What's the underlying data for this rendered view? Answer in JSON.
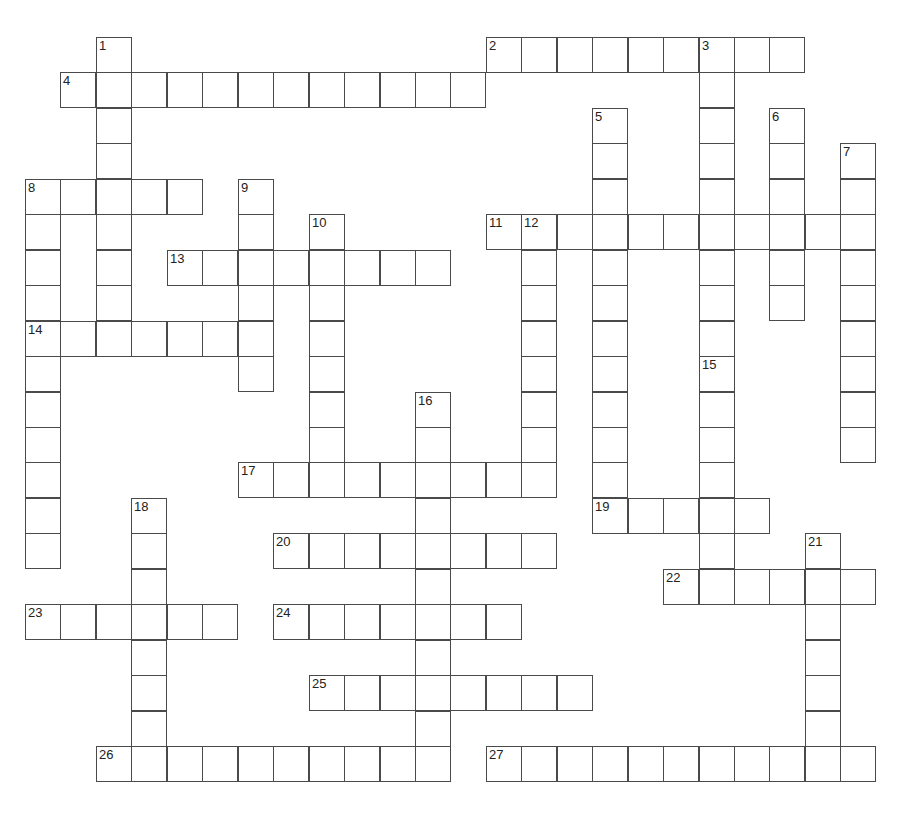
{
  "puzzle": {
    "type": "crossword",
    "grid": {
      "origin_x": 25,
      "origin_y": 37,
      "cell": 35.45
    },
    "words": [
      {
        "num": 1,
        "dir": "down",
        "col": 2,
        "row": 0,
        "len": 8
      },
      {
        "num": 2,
        "dir": "across",
        "col": 13,
        "row": 0,
        "len": 9
      },
      {
        "num": 3,
        "dir": "down",
        "col": 19,
        "row": 0,
        "len": 9
      },
      {
        "num": 4,
        "dir": "across",
        "col": 1,
        "row": 1,
        "len": 12
      },
      {
        "num": 5,
        "dir": "down",
        "col": 16,
        "row": 2,
        "len": 12
      },
      {
        "num": 6,
        "dir": "down",
        "col": 21,
        "row": 2,
        "len": 6
      },
      {
        "num": 7,
        "dir": "down",
        "col": 23,
        "row": 3,
        "len": 9
      },
      {
        "num": 8,
        "dir": "across",
        "col": 0,
        "row": 4,
        "len": 5
      },
      {
        "num": 8,
        "dir": "down",
        "col": 0,
        "row": 4,
        "len": 11
      },
      {
        "num": 9,
        "dir": "down",
        "col": 6,
        "row": 4,
        "len": 6
      },
      {
        "num": 10,
        "dir": "down",
        "col": 8,
        "row": 5,
        "len": 8
      },
      {
        "num": 11,
        "dir": "across",
        "col": 13,
        "row": 5,
        "len": 11
      },
      {
        "num": 12,
        "dir": "down",
        "col": 14,
        "row": 5,
        "len": 8
      },
      {
        "num": 13,
        "dir": "across",
        "col": 4,
        "row": 6,
        "len": 8
      },
      {
        "num": 14,
        "dir": "across",
        "col": 0,
        "row": 8,
        "len": 7
      },
      {
        "num": 15,
        "dir": "down",
        "col": 19,
        "row": 9,
        "len": 7
      },
      {
        "num": 16,
        "dir": "down",
        "col": 11,
        "row": 10,
        "len": 11
      },
      {
        "num": 17,
        "dir": "across",
        "col": 6,
        "row": 12,
        "len": 9
      },
      {
        "num": 18,
        "dir": "down",
        "col": 3,
        "row": 13,
        "len": 8
      },
      {
        "num": 19,
        "dir": "across",
        "col": 16,
        "row": 13,
        "len": 5
      },
      {
        "num": 20,
        "dir": "across",
        "col": 7,
        "row": 14,
        "len": 8
      },
      {
        "num": 21,
        "dir": "down",
        "col": 22,
        "row": 14,
        "len": 7
      },
      {
        "num": 22,
        "dir": "across",
        "col": 18,
        "row": 15,
        "len": 6
      },
      {
        "num": 23,
        "dir": "across",
        "col": 0,
        "row": 16,
        "len": 6
      },
      {
        "num": 24,
        "dir": "across",
        "col": 7,
        "row": 16,
        "len": 7
      },
      {
        "num": 25,
        "dir": "across",
        "col": 8,
        "row": 18,
        "len": 8
      },
      {
        "num": 26,
        "dir": "across",
        "col": 2,
        "row": 20,
        "len": 10
      },
      {
        "num": 27,
        "dir": "across",
        "col": 13,
        "row": 20,
        "len": 11
      }
    ]
  }
}
